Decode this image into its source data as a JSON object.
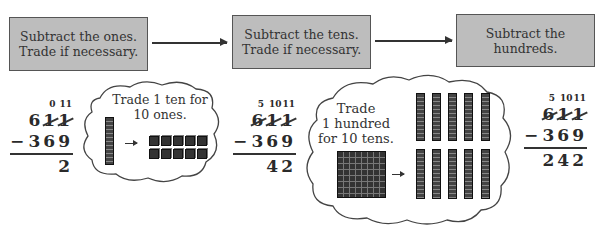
{
  "steps": [
    {
      "line1": "Subtract the ones.",
      "line2": "Trade if necessary."
    },
    {
      "line1": "Subtract the tens.",
      "line2": "Trade if necessary."
    },
    {
      "line1": "Subtract the",
      "line2": "hundreds."
    }
  ],
  "problems": [
    {
      "carry": {
        "hundreds": "",
        "tens": "0",
        "ones": "11"
      },
      "top": {
        "hundreds": "6",
        "tens": "1",
        "ones": "1"
      },
      "struck": {
        "hundreds": false,
        "tens": true,
        "ones": true
      },
      "operator": "−",
      "bottom": "369",
      "result": "2"
    },
    {
      "carry": {
        "hundreds": "5",
        "tens": "10",
        "ones": "11"
      },
      "top": {
        "hundreds": "6",
        "tens": "1",
        "ones": "1"
      },
      "struck": {
        "hundreds": true,
        "tens": true,
        "ones": true
      },
      "operator": "−",
      "bottom": "369",
      "result": "42"
    },
    {
      "carry": {
        "hundreds": "5",
        "tens": "10",
        "ones": "11"
      },
      "top": {
        "hundreds": "6",
        "tens": "1",
        "ones": "1"
      },
      "struck": {
        "hundreds": true,
        "tens": true,
        "ones": true
      },
      "operator": "−",
      "bottom": "369",
      "result": "242"
    }
  ],
  "clouds": [
    {
      "line1": "Trade 1 ten for",
      "line2": "10 ones.",
      "from": "1 ten rod",
      "to": "10 unit cubes"
    },
    {
      "line1": "Trade",
      "line2": "1 hundred",
      "line3": "for 10 tens.",
      "from": "1 hundred flat",
      "to": "10 ten rods"
    }
  ]
}
